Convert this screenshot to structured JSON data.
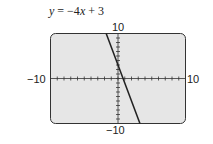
{
  "chart_data": {
    "type": "line",
    "title": "y = −4x + 3",
    "equation": {
      "slope": -4,
      "intercept": 3
    },
    "x": [
      -1.75,
      3.25
    ],
    "series": [
      {
        "name": "y = -4x + 3",
        "values": [
          10,
          -10
        ]
      }
    ],
    "xlim": [
      -10,
      10
    ],
    "ylim": [
      -10,
      10
    ],
    "xscale": 1,
    "yscale": 1,
    "tick_labels": {
      "x_min": "−10",
      "x_max": "10",
      "y_min": "−10",
      "y_max": "10"
    },
    "grid": false,
    "background": "#e6e6e6",
    "line_color": "#222222"
  }
}
